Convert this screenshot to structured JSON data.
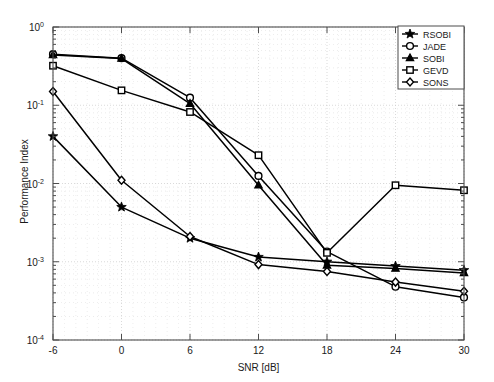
{
  "chart_data": {
    "type": "line",
    "title": "",
    "xlabel": "SNR [dB]",
    "ylabel": "Performance Index",
    "xlim": [
      -6,
      30
    ],
    "ylim": [
      0.0001,
      1
    ],
    "yscale": "log",
    "xticks": [
      -6,
      0,
      6,
      12,
      18,
      24,
      30
    ],
    "xticklabels": [
      "-6",
      "0",
      "6",
      "12",
      "18",
      "24",
      "30"
    ],
    "yticks": [
      1,
      0.1,
      0.01,
      0.001,
      0.0001
    ],
    "yticklabels": [
      "10^0",
      "10^-1",
      "10^-2",
      "10^-3",
      "10^-4"
    ],
    "grid": true,
    "grid_minor": true,
    "legend_position": "upper right",
    "x": [
      -6,
      0,
      6,
      12,
      18,
      24,
      30
    ],
    "series": [
      {
        "name": "RSOBI",
        "marker": "star",
        "values": [
          0.04,
          0.005,
          0.002,
          0.00115,
          0.001,
          0.00088,
          0.00078
        ]
      },
      {
        "name": "JADE",
        "marker": "circle",
        "values": [
          0.45,
          0.4,
          0.125,
          0.0125,
          0.00135,
          0.00048,
          0.00035
        ]
      },
      {
        "name": "SOBI",
        "marker": "triangle",
        "values": [
          0.44,
          0.395,
          0.105,
          0.0095,
          0.0009,
          0.00082,
          0.00072
        ]
      },
      {
        "name": "GEVD",
        "marker": "square",
        "values": [
          0.32,
          0.155,
          0.082,
          0.023,
          0.0013,
          0.0095,
          0.0082
        ]
      },
      {
        "name": "SONS",
        "marker": "diamond",
        "values": [
          0.15,
          0.011,
          0.0021,
          0.00092,
          0.00075,
          0.00055,
          0.00042
        ]
      }
    ],
    "legend": [
      "RSOBI",
      "JADE",
      "SOBI",
      "GEVD",
      "SONS"
    ],
    "colors": {
      "line": "#000000",
      "grid": "#cfcfcf",
      "axis": "#4d4d4d",
      "background": "#ffffff"
    }
  }
}
